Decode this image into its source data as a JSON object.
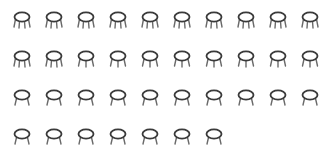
{
  "figure": {
    "colors": {
      "seat": "#3a3a3a",
      "legs": "#6a6a6a",
      "background": "#ffffff"
    },
    "rows": [
      {
        "count": 10,
        "legs": [
          4,
          4,
          4,
          4,
          4,
          4,
          4,
          4,
          4,
          4
        ]
      },
      {
        "count": 10,
        "legs": [
          4,
          4,
          3,
          3,
          3,
          3,
          3,
          3,
          3,
          3
        ]
      },
      {
        "count": 10,
        "legs": [
          2,
          2,
          2,
          2,
          2,
          2,
          2,
          2,
          2,
          2
        ]
      },
      {
        "count": 7,
        "legs": [
          2,
          2,
          2,
          2,
          2,
          2,
          2
        ]
      }
    ],
    "total_icons": 37,
    "icon": "stool-icon"
  }
}
